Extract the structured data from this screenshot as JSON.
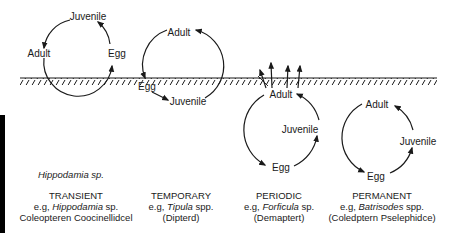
{
  "diagram": {
    "title": "",
    "ground_label": "",
    "species_note": "Hippodamia sp.",
    "stages": {
      "adult": "Adult",
      "juvenile": "Juvenile",
      "egg": "Egg"
    },
    "cycles": [
      {
        "id": "transient",
        "category": "TRANSIENT",
        "example_prefix": "e.g, ",
        "example_genus": "Hippodamia",
        "example_suffix": " sp.",
        "taxon": "Coleopteren Coocinellidcel",
        "labels": {
          "top": "Juvenile",
          "left": "Adult",
          "right": "Egg"
        },
        "position": "above ground, egg at soil surface"
      },
      {
        "id": "temporary",
        "category": "TEMPORARY",
        "example_prefix": "e.g, ",
        "example_genus": "Tipula",
        "example_suffix": " spp.",
        "taxon": "(Dipterd)",
        "labels": {
          "top": "Adult",
          "left": "Egg",
          "bottom": "Juvenile"
        },
        "position": "straddles ground, juvenile below"
      },
      {
        "id": "periodic",
        "category": "PERIODIC",
        "example_prefix": "e.g, ",
        "example_genus": "Forficula",
        "example_suffix": " sp.",
        "taxon": "(Demaptert)",
        "labels": {
          "top": "Adult",
          "right": "Juvenile",
          "bottom": "Egg"
        },
        "position": "below ground, adult emerges periodically"
      },
      {
        "id": "permanent",
        "category": "PERMANENT",
        "example_prefix": "e.g, ",
        "example_genus": "Batrisodes",
        "example_suffix": " spp.",
        "taxon": "(Coledptern Pselephidce)",
        "labels": {
          "top": "Adult",
          "right": "Juvenile",
          "bottom": "Egg"
        },
        "position": "entirely below ground"
      }
    ],
    "colors": {
      "ink": "#1a1a1a",
      "background": "#ffffff",
      "side_bar": "#000000"
    }
  }
}
